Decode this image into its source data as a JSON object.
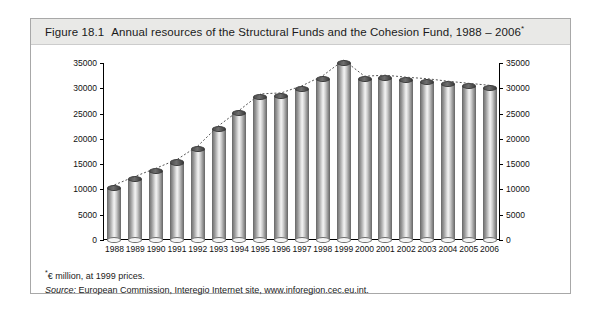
{
  "figure": {
    "number": "Figure 18.1",
    "title": "Annual resources of the Structural Funds and the Cohesion Fund, 1988 – 2006",
    "title_footnote_marker": "*"
  },
  "notes": {
    "unit_marker": "*",
    "unit_note": "€ million, at 1999 prices.",
    "source_label": "Source:",
    "source_text": "European Commission, Interegio Internet site, www.inforegion.cec.eu.int."
  },
  "colors": {
    "title_band": "#e9e9e7",
    "frame": "#a8a8a8",
    "axis": "#000000",
    "bar_dark": "#7c7c7c",
    "bar_light": "#f2f2f2",
    "bar_cap": "#4e4e4e",
    "trend_line": "#555555"
  },
  "chart_data": {
    "type": "bar",
    "title": "Annual resources of the Structural Funds and the Cohesion Fund, 1988 – 2006",
    "xlabel": "",
    "ylabel": "",
    "unit": "€ million, at 1999 prices",
    "grid": false,
    "legend": false,
    "dual_axis": true,
    "ylim": [
      0,
      35000
    ],
    "yticks": [
      0,
      5000,
      10000,
      15000,
      20000,
      25000,
      30000,
      35000
    ],
    "ytick_labels_left": [
      "0",
      "5000",
      "10000",
      "15000",
      "20000",
      "25000",
      "30000",
      "35000"
    ],
    "ytick_labels_right": [
      "0",
      "5000",
      "10000",
      "15000",
      "20000",
      "25000",
      "30000",
      "35000"
    ],
    "categories": [
      "1988",
      "1989",
      "1990",
      "1991",
      "1992",
      "1993",
      "1994",
      "1995",
      "1996",
      "1997",
      "1998",
      "1999",
      "2000",
      "2001",
      "2002",
      "2003",
      "2004",
      "2005",
      "2006"
    ],
    "values": [
      10300,
      12000,
      13600,
      15300,
      18000,
      22000,
      25100,
      28300,
      28500,
      29900,
      31900,
      35000,
      31800,
      32000,
      31600,
      31300,
      30800,
      30400,
      30000
    ],
    "overlay": {
      "type": "line",
      "style": "dotted",
      "values": [
        10300,
        12000,
        13600,
        15300,
        18000,
        22000,
        25100,
        28300,
        28500,
        29900,
        31900,
        35000,
        31800,
        32000,
        31600,
        31300,
        30800,
        30400,
        30000
      ]
    }
  }
}
